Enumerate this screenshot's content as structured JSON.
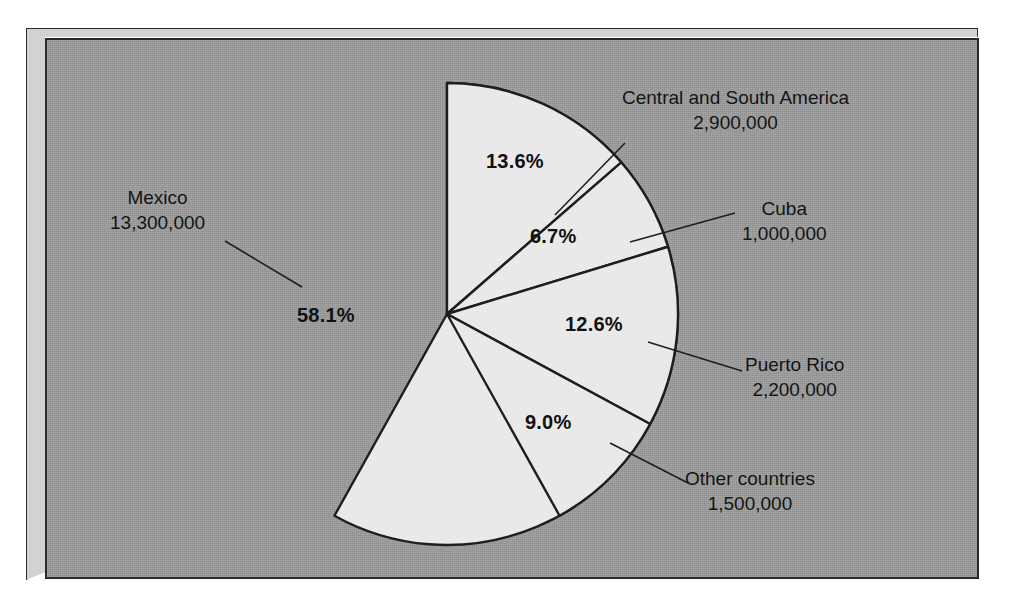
{
  "chart_data": {
    "type": "pie",
    "title": "",
    "subtitle": "",
    "xlabel": "",
    "ylabel": "",
    "legend_position": "callout-labels",
    "grid": false,
    "units": "people",
    "categories": [
      "Mexico",
      "Central and South America",
      "Cuba",
      "Puerto Rico",
      "Other countries"
    ],
    "values": [
      13300000,
      2900000,
      1000000,
      2200000,
      1500000
    ],
    "value_labels": [
      "13,300,000",
      "2,900,000",
      "1,000,000",
      "2,200,000",
      "1,500,000"
    ],
    "percentages": [
      58.1,
      13.6,
      6.7,
      12.6,
      9.0
    ],
    "percent_labels": [
      "58.1%",
      "13.6%",
      "6.7%",
      "12.6%",
      "9.0%"
    ],
    "slices": [
      {
        "name": "Mexico",
        "value_label": "13,300,000",
        "percent_label": "58.1%",
        "percent": 58.1,
        "start_angle_deg": 0,
        "end_angle_deg": 209.16,
        "fill": "#e9e9e9",
        "pct_x": 297,
        "pct_y": 304,
        "label_x": 110,
        "label_y": 185,
        "label_align": "center",
        "leader": [
          [
            225,
            241
          ],
          [
            302,
            287
          ]
        ]
      },
      {
        "name": "Central and South America",
        "value_label": "2,900,000",
        "percent_label": "13.6%",
        "percent": 13.6,
        "start_angle_deg": 0,
        "end_angle_deg": 48.96,
        "fill": "#e9e9e9",
        "pct_x": 486,
        "pct_y": 150,
        "label_x": 622,
        "label_y": 85,
        "label_align": "center",
        "leader": [
          [
            555,
            215
          ],
          [
            625,
            143
          ]
        ]
      },
      {
        "name": "Cuba",
        "value_label": "1,000,000",
        "percent_label": "6.7%",
        "percent": 6.7,
        "start_angle_deg": 48.96,
        "end_angle_deg": 73.08,
        "fill": "#e9e9e9",
        "pct_x": 530,
        "pct_y": 225,
        "label_x": 742,
        "label_y": 196,
        "label_align": "center",
        "leader": [
          [
            630,
            242
          ],
          [
            735,
            213
          ]
        ]
      },
      {
        "name": "Puerto Rico",
        "value_label": "2,200,000",
        "percent_label": "12.6%",
        "percent": 12.6,
        "start_angle_deg": 73.08,
        "end_angle_deg": 118.44,
        "fill": "#e9e9e9",
        "pct_x": 565,
        "pct_y": 313,
        "label_x": 745,
        "label_y": 352,
        "label_align": "center",
        "leader": [
          [
            648,
            342
          ],
          [
            742,
            371
          ]
        ]
      },
      {
        "name": "Other countries",
        "value_label": "1,500,000",
        "percent_label": "9.0%",
        "percent": 9.0,
        "start_angle_deg": 118.44,
        "end_angle_deg": 150.84,
        "fill": "#e9e9e9",
        "pct_x": 525,
        "pct_y": 411,
        "label_x": 685,
        "label_y": 466,
        "label_align": "center",
        "leader": [
          [
            610,
            443
          ],
          [
            688,
            483
          ]
        ]
      }
    ],
    "geometry": {
      "center_x": 447,
      "center_y": 314,
      "radius": 231
    },
    "colors": {
      "background": "#9b9b9b",
      "slice_fill": "#e9e9e9",
      "outline": "#1e1e1e",
      "frame_bevel": "#d2d2d2",
      "text": "#141414"
    }
  }
}
